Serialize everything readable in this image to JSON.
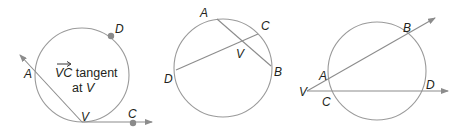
{
  "figures": [
    {
      "id": "tangent-secant",
      "description": "Circle with tangent ray VC at V and secant through A",
      "points": {
        "A": "A",
        "D": "D",
        "V": "V",
        "C": "C"
      },
      "annotation": {
        "ray_name": "VC",
        "line1_rest": " tangent",
        "line2_prefix": "at ",
        "line2_point": "V"
      }
    },
    {
      "id": "intersecting-chords",
      "description": "Circle with chords AB and CD intersecting at V inside the circle",
      "points": {
        "A": "A",
        "B": "B",
        "C": "C",
        "D": "D",
        "V": "V"
      }
    },
    {
      "id": "two-secants",
      "description": "Two secant rays from exterior point V",
      "points": {
        "A": "A",
        "B": "B",
        "C": "C",
        "D": "D",
        "V": "V"
      }
    }
  ],
  "colors": {
    "stroke": "#8c8c8c",
    "circle": "#9a9a9a",
    "label": "#231f20",
    "dot": "#8a8a8a"
  }
}
